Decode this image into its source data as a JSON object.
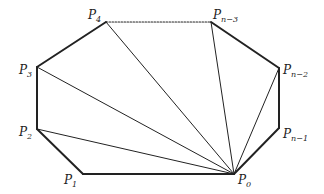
{
  "diagram": {
    "colors": {
      "stroke": "#222222",
      "background": "#ffffff"
    },
    "vertices": [
      {
        "id": "P0",
        "base": "P",
        "sub": "0",
        "x": 234,
        "y": 174,
        "lx": 238,
        "ly": 184
      },
      {
        "id": "P1",
        "base": "P",
        "sub": "1",
        "x": 83,
        "y": 174,
        "lx": 64,
        "ly": 184
      },
      {
        "id": "P2",
        "base": "P",
        "sub": "2",
        "x": 37,
        "y": 129,
        "lx": 19,
        "ly": 136
      },
      {
        "id": "P3",
        "base": "P",
        "sub": "3",
        "x": 37,
        "y": 67,
        "lx": 19,
        "ly": 74
      },
      {
        "id": "P4",
        "base": "P",
        "sub": "4",
        "x": 106,
        "y": 22,
        "lx": 88,
        "ly": 19
      },
      {
        "id": "Pn-3",
        "base": "P",
        "sub": "n−3",
        "x": 211,
        "y": 22,
        "lx": 213,
        "ly": 19
      },
      {
        "id": "Pn-2",
        "base": "P",
        "sub": "n−2",
        "x": 279,
        "y": 68,
        "lx": 283,
        "ly": 74
      },
      {
        "id": "Pn-1",
        "base": "P",
        "sub": "n−1",
        "x": 279,
        "y": 128,
        "lx": 283,
        "ly": 138
      }
    ],
    "boundary_edges": [
      [
        "P0",
        "P1"
      ],
      [
        "P1",
        "P2"
      ],
      [
        "P2",
        "P3"
      ],
      [
        "P3",
        "P4"
      ],
      [
        "Pn-3",
        "Pn-2"
      ],
      [
        "Pn-2",
        "Pn-1"
      ],
      [
        "Pn-1",
        "P0"
      ]
    ],
    "dotted_edges": [
      [
        "P4",
        "Pn-3"
      ]
    ],
    "diagonals": [
      [
        "P0",
        "P2"
      ],
      [
        "P0",
        "P3"
      ],
      [
        "P0",
        "P4"
      ],
      [
        "P0",
        "Pn-3"
      ],
      [
        "P0",
        "Pn-2"
      ]
    ]
  }
}
